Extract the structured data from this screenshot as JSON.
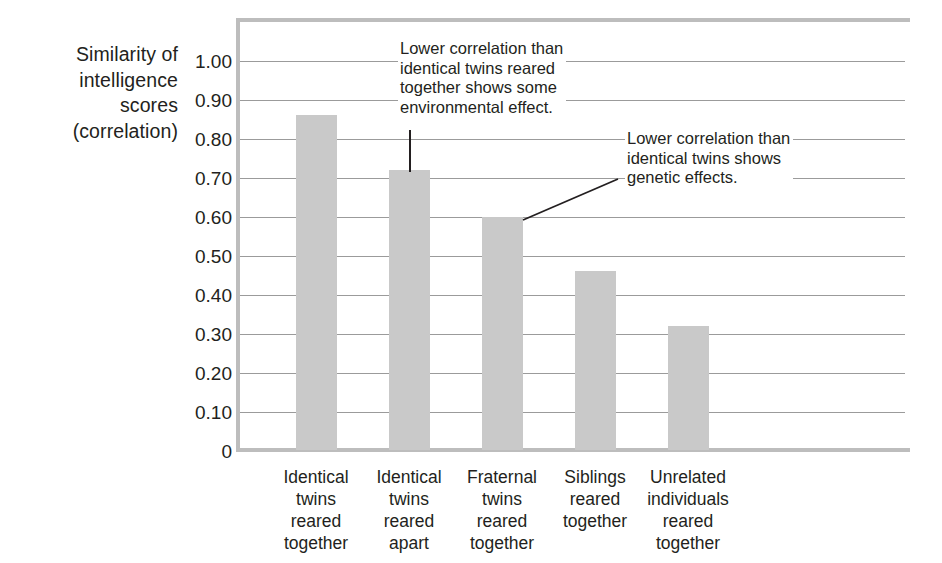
{
  "chart_data": {
    "type": "bar",
    "title": "",
    "xlabel": "",
    "ylabel": "Similarity of intelligence scores (correlation)",
    "ylabel_lines": [
      "Similarity of",
      "intelligence",
      "scores",
      "(correlation)"
    ],
    "categories": [
      "Identical twins reared together",
      "Identical twins reared apart",
      "Fraternal twins reared together",
      "Siblings reared together",
      "Unrelated individuals reared together"
    ],
    "category_lines": [
      [
        "Identical",
        "twins",
        "reared",
        "together"
      ],
      [
        "Identical",
        "twins",
        "reared",
        "apart"
      ],
      [
        "Fraternal",
        "twins",
        "reared",
        "together"
      ],
      [
        "Siblings",
        "reared",
        "together"
      ],
      [
        "Unrelated",
        "individuals",
        "reared",
        "together"
      ]
    ],
    "values": [
      0.86,
      0.72,
      0.6,
      0.46,
      0.32
    ],
    "ylim": [
      0,
      1.0
    ],
    "ytick_values": [
      1.0,
      0.9,
      0.8,
      0.7,
      0.6,
      0.5,
      0.4,
      0.3,
      0.2,
      0.1,
      0
    ],
    "ytick_labels": [
      "1.00",
      "0.90",
      "0.80",
      "0.70",
      "0.60",
      "0.50",
      "0.40",
      "0.30",
      "0.20",
      "0.10",
      "0"
    ],
    "grid": true,
    "legend": false,
    "bar_color": "#c9c9c9",
    "gridline_color": "#9b9b9b",
    "frame_color": "#bdbdbd",
    "text_color": "#231f20",
    "annotations": [
      {
        "id": "annotation-1",
        "lines": [
          "Lower correlation than",
          "identical twins reared",
          "together shows some",
          "environmental effect."
        ],
        "points_to_category": "Identical twins reared apart",
        "leader": "vertical"
      },
      {
        "id": "annotation-2",
        "lines": [
          "Lower correlation than",
          "identical twins shows",
          "genetic effects."
        ],
        "points_to_category": "Fraternal twins reared together",
        "leader": "diagonal"
      }
    ]
  },
  "credit": "© Christopher Fitzgerald/The Image Works"
}
